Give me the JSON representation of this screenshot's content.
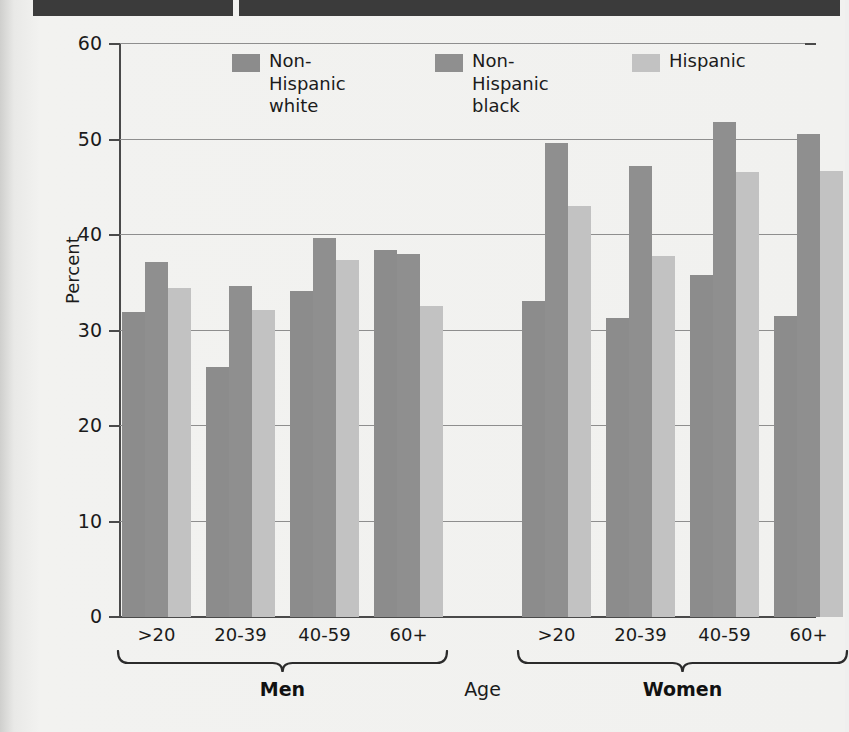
{
  "header": {
    "blocks": [
      "",
      ""
    ]
  },
  "chart_data": {
    "type": "bar",
    "title": "",
    "xlabel": "Age",
    "ylabel": "Percent",
    "ylim": [
      0,
      60
    ],
    "yticks": [
      0,
      10,
      20,
      30,
      40,
      50,
      60
    ],
    "grid": true,
    "legend_position": "top-center",
    "categories": [
      "Men >20",
      "Men 20-39",
      "Men 40-59",
      "Men 60+",
      "Women >20",
      "Women 20-39",
      "Women 40-59",
      "Women 60+"
    ],
    "age_tick_labels": [
      ">20",
      "20-39",
      "40-59",
      "60+",
      ">20",
      "20-39",
      "40-59",
      "60+"
    ],
    "group_labels": [
      "Men",
      "Women"
    ],
    "series": [
      {
        "name": "Non-Hispanic white",
        "label_line1": "Non-Hispanic",
        "label_line2": "white",
        "color": "#8c8c8c",
        "values": [
          31.9,
          26.2,
          34.1,
          38.4,
          33.1,
          31.3,
          35.8,
          31.5
        ]
      },
      {
        "name": "Non-Hispanic black",
        "label_line1": "Non-Hispanic",
        "label_line2": "black",
        "color": "#8f8f8f",
        "values": [
          37.2,
          34.7,
          39.7,
          38.0,
          49.6,
          47.2,
          51.8,
          50.6
        ]
      },
      {
        "name": "Hispanic",
        "label_line1": "Hispanic",
        "label_line2": "",
        "color": "#c2c2c2",
        "values": [
          34.4,
          32.2,
          37.4,
          32.6,
          43.0,
          37.8,
          46.6,
          46.7
        ]
      }
    ]
  }
}
